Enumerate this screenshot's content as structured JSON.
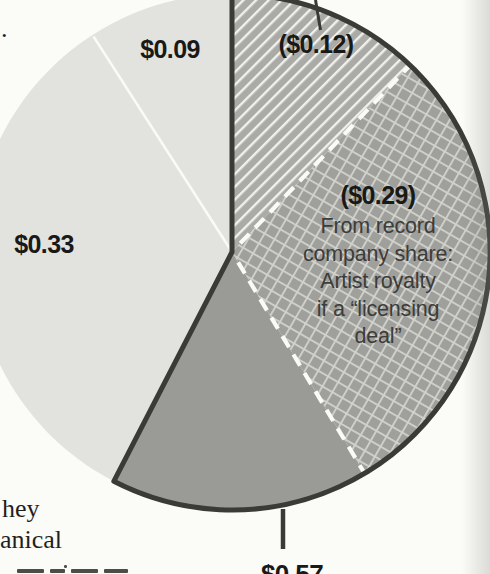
{
  "page": {
    "background_color": "#fbfbf8",
    "text_fragments": [
      {
        "id": "punctuation-dot",
        "text": "."
      },
      {
        "id": "body-line-1",
        "text": "hey"
      },
      {
        "id": "body-line-2",
        "text": "anical"
      }
    ]
  },
  "chart_data": {
    "type": "pie",
    "direction": "clockwise",
    "start_angle_deg": 0,
    "total": 0.99,
    "slices": [
      {
        "id": "artist-royalty-typical",
        "label": "($0.12)",
        "value": 0.12,
        "style": "diagonal-hatch"
      },
      {
        "id": "artist-royalty-licensing",
        "label": "($0.29)",
        "value": 0.29,
        "style": "crosshatch",
        "annotation_lines": [
          "From record",
          "company share:",
          "Artist royalty",
          "if a “licensing",
          "deal”"
        ]
      },
      {
        "id": "record-company-remainder",
        "label": "",
        "value": 0.16,
        "style": "solid-dark"
      },
      {
        "id": "share-033",
        "label": "$0.33",
        "value": 0.33,
        "style": "solid-light"
      },
      {
        "id": "share-009",
        "label": "$0.09",
        "value": 0.09,
        "style": "solid-light"
      }
    ],
    "outlined_group": {
      "label": "$0.57",
      "value": 0.57,
      "slice_indexes": [
        0,
        1,
        2
      ]
    },
    "separators": [
      {
        "after_slice": 0,
        "style": "white-dashed"
      },
      {
        "after_slice": 1,
        "style": "white-dashed"
      },
      {
        "after_slice": 3,
        "style": "white-solid"
      }
    ],
    "colors": {
      "light": "#e2e2de",
      "dark": "#9a9a96",
      "hatch_bg": "#aaaaa6",
      "crosshatch_bg": "#9f9f9b",
      "hatch_line": "#f0f0ec",
      "crosshatch_line": "#d2d2cd",
      "outline": "#3a3a37",
      "separator_white": "#fafaf7",
      "label_text": "#191917",
      "annotation_text": "#3c3c3a"
    }
  }
}
